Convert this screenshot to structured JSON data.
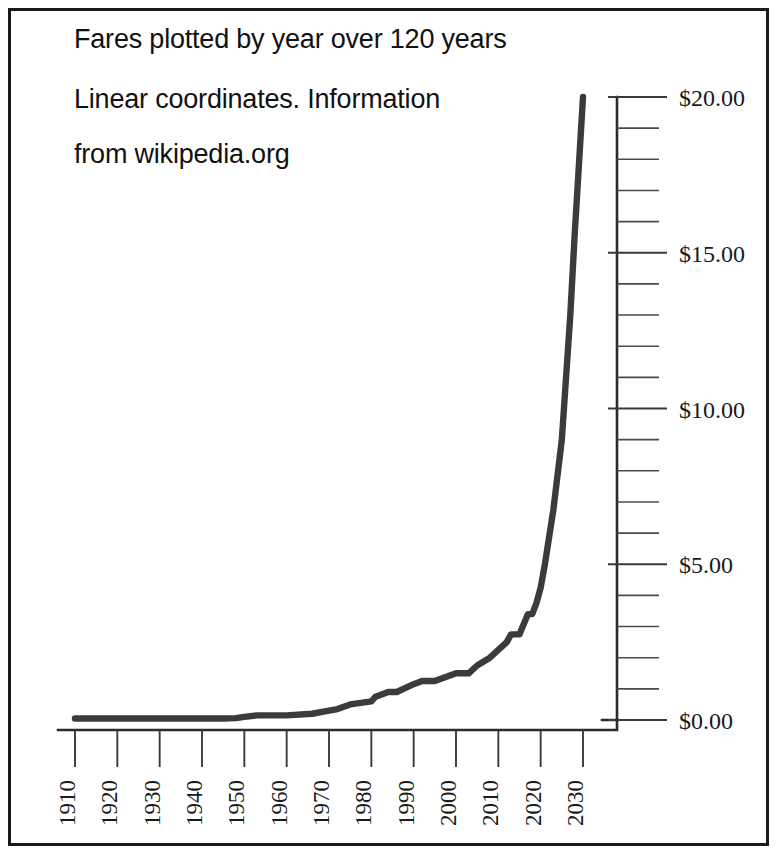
{
  "figure": {
    "background_color": "#ffffff",
    "border_color": "#1a1a1a",
    "curve_color": "#3b3b3b",
    "axis_color": "#2b2b2b"
  },
  "annotation": {
    "line1": "Fares plotted by year over 120 years",
    "line2": "Linear coordinates. Information",
    "line3": "from wikipedia.org"
  },
  "chart_data": {
    "type": "line",
    "title": "Fares plotted by year over 120 years",
    "subtitle": "Linear coordinates. Information from wikipedia.org",
    "xlabel": "",
    "ylabel": "",
    "xlim": [
      1910,
      2030
    ],
    "ylim": [
      0,
      20
    ],
    "grid": false,
    "legend": null,
    "y_axis": {
      "position": "right",
      "tick_labels": [
        "$0.00",
        "$5.00",
        "$10.00",
        "$15.00",
        "$20.00"
      ],
      "tick_values": [
        0,
        5,
        10,
        15,
        20
      ],
      "minor_tick_step": 1,
      "minor_tick_values": [
        1,
        2,
        3,
        4,
        6,
        7,
        8,
        9,
        11,
        12,
        13,
        14,
        16,
        17,
        18,
        19
      ],
      "prefix": "$",
      "decimals": 2
    },
    "x_axis": {
      "position": "bottom",
      "tick_labels": [
        "1910",
        "1920",
        "1930",
        "1940",
        "1950",
        "1960",
        "1970",
        "1980",
        "1990",
        "2000",
        "2010",
        "2020",
        "2030"
      ],
      "tick_values": [
        1910,
        1920,
        1930,
        1940,
        1950,
        1960,
        1970,
        1980,
        1990,
        2000,
        2010,
        2020,
        2030
      ],
      "label_rotation": -90
    },
    "series": [
      {
        "name": "Fare",
        "units": "USD",
        "x": [
          1910,
          1915,
          1920,
          1925,
          1930,
          1935,
          1940,
          1945,
          1948,
          1950,
          1953,
          1955,
          1960,
          1966,
          1970,
          1972,
          1975,
          1980,
          1981,
          1984,
          1986,
          1990,
          1992,
          1995,
          2000,
          2003,
          2005,
          2008,
          2010,
          2012,
          2013,
          2015,
          2017,
          2018,
          2019,
          2020,
          2021,
          2023,
          2025,
          2027,
          2028,
          2029,
          2030
        ],
        "y": [
          0.05,
          0.05,
          0.05,
          0.05,
          0.05,
          0.05,
          0.05,
          0.05,
          0.06,
          0.1,
          0.15,
          0.15,
          0.15,
          0.2,
          0.3,
          0.35,
          0.5,
          0.6,
          0.75,
          0.9,
          0.9,
          1.15,
          1.25,
          1.25,
          1.5,
          1.5,
          1.75,
          2.0,
          2.25,
          2.5,
          2.75,
          2.75,
          3.4,
          3.4,
          3.75,
          4.25,
          5.0,
          6.75,
          9.0,
          13.0,
          15.5,
          17.75,
          20.0
        ]
      }
    ]
  }
}
